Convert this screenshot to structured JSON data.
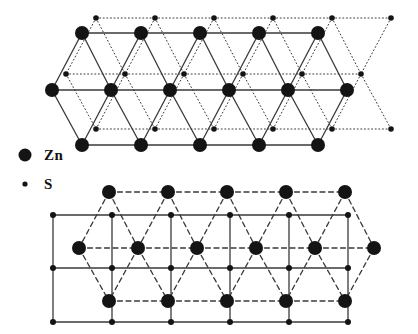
{
  "figure": {
    "background_color": "#ffffff",
    "atom_color": "#141414",
    "line_color": "#3a3a3a"
  },
  "legend": {
    "items": [
      {
        "symbol": "zn-marker",
        "label": "Zn",
        "marker": "large-filled-circle",
        "radius": 6.5
      },
      {
        "symbol": "s-marker",
        "label": "S",
        "marker": "small-filled-dot",
        "radius": 2.6
      }
    ]
  },
  "chart_data": {
    "type": "scatter",
    "xlabel": "",
    "ylabel": "",
    "xlim": [
      0,
      418
    ],
    "ylim": [
      0,
      334
    ],
    "grid": false,
    "legend_position": "left-middle",
    "panels": [
      {
        "name": "upper-lattice",
        "zn_line_style": "solid",
        "s_line_style": "dotted",
        "zn_radius": 7.0,
        "s_radius": 2.8,
        "zn_rows": [
          {
            "y": 33,
            "x": [
              82,
              141,
              200,
              259,
              318
            ]
          },
          {
            "y": 90,
            "x": [
              52,
              111,
              170,
              229,
              288,
              347
            ]
          },
          {
            "y": 145,
            "x": [
              82,
              141,
              200,
              259,
              318
            ]
          }
        ],
        "s_rows": [
          {
            "y": 18,
            "x": [
              96,
              155,
              214,
              273,
              332,
              391
            ]
          },
          {
            "y": 74,
            "x": [
              66,
              125,
              184,
              243,
              302,
              361
            ]
          },
          {
            "y": 129,
            "x": [
              96,
              155,
              214,
              273,
              332,
              391
            ]
          }
        ]
      },
      {
        "name": "lower-lattice",
        "zn_line_style": "dashed",
        "s_line_style": "solid",
        "zn_radius": 7.0,
        "s_radius": 3.0,
        "zn_rows": [
          {
            "y": 192,
            "x": [
              109,
              168,
              227,
              286,
              345
            ]
          },
          {
            "y": 248,
            "x": [
              79,
              138,
              197,
              256,
              315,
              374
            ]
          },
          {
            "y": 301,
            "x": [
              109,
              168,
              227,
              286,
              345
            ]
          }
        ],
        "s_rows": [
          {
            "y": 215,
            "x": [
              53,
              112,
              171,
              230,
              289,
              348
            ]
          },
          {
            "y": 268,
            "x": [
              53,
              112,
              171,
              230,
              289,
              348
            ]
          },
          {
            "y": 322,
            "x": [
              53,
              112,
              171,
              230,
              289,
              348
            ]
          }
        ]
      }
    ]
  }
}
